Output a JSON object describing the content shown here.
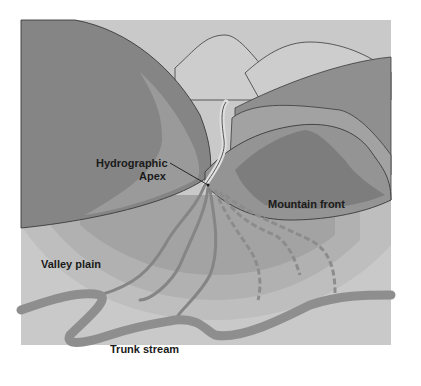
{
  "diagram": {
    "labels": {
      "hydrographic_apex_line1": "Hydrographic",
      "hydrographic_apex_line2": "Apex",
      "mountain_front": "Mountain front",
      "valley_plain": "Valley plain",
      "trunk_stream": "Trunk stream"
    },
    "colors": {
      "sky": "#c9c9c9",
      "far_mountain": "#cdcdcd",
      "dark_mountain": "#8a8a8a",
      "mid_mountain": "#9c9c9c",
      "fan_inner": "#a3a3a3",
      "fan_mid": "#b1b1b1",
      "fan_outer": "#bebebe",
      "valley_plain": "#c9c9c9",
      "stream": "#8e8e8e",
      "outline": "#3a3a3a"
    }
  }
}
